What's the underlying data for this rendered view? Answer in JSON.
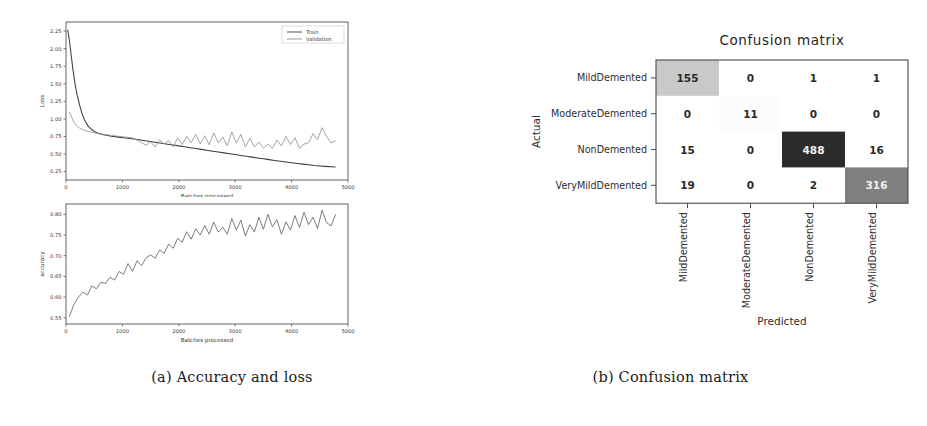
{
  "figure_a": {
    "caption": "(a) Accuracy and loss",
    "charts": [
      {
        "id": "loss",
        "type": "line",
        "title": "",
        "xlabel": "Batches processed",
        "ylabel": "Loss",
        "xlim": [
          0,
          5000
        ],
        "ylim": [
          0.13,
          2.38
        ],
        "xticks": [
          0,
          1000,
          2000,
          3000,
          4000,
          5000
        ],
        "xticklabels": [
          "0",
          "1000",
          "2000",
          "3000",
          "4000",
          "5000"
        ],
        "yticks": [
          0.25,
          0.5,
          0.75,
          1.0,
          1.25,
          1.5,
          1.75,
          2.0,
          2.25
        ],
        "yticklabels": [
          "0.25",
          "0.50",
          "0.75",
          "1.00",
          "1.25",
          "1.50",
          "1.75",
          "2.00",
          "2.25"
        ],
        "grid": false,
        "legend_position": "upper right",
        "series": [
          {
            "name": "Train",
            "color": "#3c3c3c",
            "x": [
              30,
              60,
              90,
              120,
              160,
              200,
              240,
              280,
              320,
              360,
              400,
              440,
              480,
              520,
              560,
              600,
              660,
              720,
              780,
              840,
              900,
              960,
              1020,
              1080,
              1140,
              1200,
              1300,
              1400,
              1500,
              1600,
              1700,
              1800,
              1900,
              2000,
              2100,
              2200,
              2300,
              2400,
              2500,
              2600,
              2700,
              2800,
              2900,
              3000,
              3100,
              3200,
              3300,
              3400,
              3500,
              3600,
              3700,
              3800,
              3900,
              4000,
              4100,
              4200,
              4300,
              4400,
              4500,
              4600,
              4700,
              4780
            ],
            "y": [
              2.27,
              2.12,
              1.92,
              1.72,
              1.5,
              1.33,
              1.2,
              1.09,
              1.0,
              0.94,
              0.89,
              0.86,
              0.835,
              0.815,
              0.8,
              0.788,
              0.775,
              0.766,
              0.757,
              0.75,
              0.744,
              0.737,
              0.731,
              0.725,
              0.72,
              0.714,
              0.702,
              0.69,
              0.678,
              0.665,
              0.652,
              0.64,
              0.628,
              0.616,
              0.603,
              0.59,
              0.578,
              0.566,
              0.553,
              0.54,
              0.528,
              0.516,
              0.504,
              0.492,
              0.48,
              0.468,
              0.456,
              0.444,
              0.432,
              0.42,
              0.408,
              0.397,
              0.386,
              0.376,
              0.366,
              0.356,
              0.346,
              0.337,
              0.33,
              0.324,
              0.319,
              0.316
            ]
          },
          {
            "name": "Validation",
            "color": "#8e8e8e",
            "x": [
              60,
              140,
              220,
              300,
              380,
              460,
              540,
              620,
              700,
              780,
              860,
              940,
              1020,
              1100,
              1180,
              1260,
              1340,
              1420,
              1500,
              1580,
              1660,
              1740,
              1820,
              1900,
              1980,
              2060,
              2140,
              2220,
              2300,
              2380,
              2460,
              2540,
              2620,
              2700,
              2780,
              2860,
              2940,
              3020,
              3100,
              3180,
              3260,
              3340,
              3420,
              3500,
              3580,
              3660,
              3740,
              3820,
              3900,
              3980,
              4060,
              4140,
              4220,
              4300,
              4380,
              4460,
              4540,
              4620,
              4700,
              4780
            ],
            "y": [
              1.1,
              0.95,
              0.88,
              0.845,
              0.825,
              0.81,
              0.795,
              0.785,
              0.775,
              0.768,
              0.76,
              0.752,
              0.745,
              0.737,
              0.73,
              0.7,
              0.66,
              0.625,
              0.675,
              0.6,
              0.705,
              0.64,
              0.69,
              0.6,
              0.73,
              0.635,
              0.75,
              0.66,
              0.78,
              0.645,
              0.76,
              0.63,
              0.8,
              0.66,
              0.74,
              0.62,
              0.815,
              0.655,
              0.78,
              0.6,
              0.725,
              0.6,
              0.67,
              0.585,
              0.64,
              0.58,
              0.7,
              0.615,
              0.75,
              0.635,
              0.73,
              0.58,
              0.64,
              0.66,
              0.79,
              0.705,
              0.875,
              0.75,
              0.66,
              0.69
            ]
          }
        ]
      },
      {
        "id": "accuracy",
        "type": "line",
        "title": "",
        "xlabel": "Batches processed",
        "ylabel": "accuracy",
        "xlim": [
          0,
          5000
        ],
        "ylim": [
          0.535,
          0.825
        ],
        "xticks": [
          0,
          1000,
          2000,
          3000,
          4000,
          5000
        ],
        "xticklabels": [
          "0",
          "1000",
          "2000",
          "3000",
          "4000",
          "5000"
        ],
        "yticks": [
          0.55,
          0.6,
          0.65,
          0.7,
          0.75,
          0.8
        ],
        "yticklabels": [
          "0.55",
          "0.60",
          "0.65",
          "0.70",
          "0.75",
          "0.80"
        ],
        "grid": false,
        "legend_position": "none",
        "series": [
          {
            "name": "Validation accuracy",
            "color": "#5a5a5a",
            "x": [
              60,
              140,
              220,
              300,
              380,
              460,
              540,
              620,
              700,
              780,
              860,
              940,
              1020,
              1100,
              1180,
              1260,
              1340,
              1420,
              1500,
              1580,
              1660,
              1740,
              1820,
              1900,
              1980,
              2060,
              2140,
              2220,
              2300,
              2380,
              2460,
              2540,
              2620,
              2700,
              2780,
              2860,
              2940,
              3020,
              3100,
              3180,
              3260,
              3340,
              3420,
              3500,
              3580,
              3660,
              3740,
              3820,
              3900,
              3980,
              4060,
              4140,
              4220,
              4300,
              4380,
              4460,
              4540,
              4620,
              4700,
              4780
            ],
            "y": [
              0.553,
              0.582,
              0.6,
              0.612,
              0.605,
              0.627,
              0.62,
              0.636,
              0.633,
              0.648,
              0.641,
              0.662,
              0.655,
              0.681,
              0.662,
              0.688,
              0.676,
              0.695,
              0.702,
              0.694,
              0.714,
              0.706,
              0.728,
              0.718,
              0.742,
              0.733,
              0.758,
              0.74,
              0.765,
              0.75,
              0.773,
              0.752,
              0.781,
              0.757,
              0.769,
              0.752,
              0.79,
              0.762,
              0.786,
              0.748,
              0.775,
              0.757,
              0.793,
              0.764,
              0.8,
              0.77,
              0.787,
              0.752,
              0.782,
              0.762,
              0.797,
              0.768,
              0.805,
              0.775,
              0.793,
              0.766,
              0.81,
              0.78,
              0.772,
              0.8
            ]
          }
        ]
      }
    ]
  },
  "figure_b": {
    "caption": "(b) Confusion matrix",
    "chart_data": {
      "type": "heatmap",
      "title": "Confusion matrix",
      "xlabel": "Predicted",
      "ylabel": "Actual",
      "row_labels": [
        "MildDemented",
        "ModerateDemented",
        "NonDemented",
        "VeryMildDemented"
      ],
      "col_labels": [
        "MildDemented",
        "ModerateDemented",
        "NonDemented",
        "VeryMildDemented"
      ],
      "values": [
        [
          155,
          0,
          1,
          1
        ],
        [
          0,
          11,
          0,
          0
        ],
        [
          15,
          0,
          488,
          16
        ],
        [
          19,
          0,
          2,
          316
        ]
      ],
      "vmax": 488,
      "colormap": "greys",
      "cell_colors": [
        [
          "#c9c9c9",
          "#ffffff",
          "#ffffff",
          "#ffffff"
        ],
        [
          "#ffffff",
          "#fcfcfc",
          "#ffffff",
          "#ffffff"
        ],
        [
          "#ffffff",
          "#ffffff",
          "#2b2b2b",
          "#ffffff"
        ],
        [
          "#ffffff",
          "#ffffff",
          "#ffffff",
          "#808080"
        ]
      ],
      "text_colors": [
        [
          "#2a2a2a",
          "#2a2a2a",
          "#2a2a2a",
          "#2a2a2a"
        ],
        [
          "#2a2a2a",
          "#2a2a2a",
          "#2a2a2a",
          "#2a2a2a"
        ],
        [
          "#2a2a2a",
          "#2a2a2a",
          "#f2f2f2",
          "#2a2a2a"
        ],
        [
          "#2a2a2a",
          "#2a2a2a",
          "#2a2a2a",
          "#f2f2f2"
        ]
      ]
    }
  }
}
